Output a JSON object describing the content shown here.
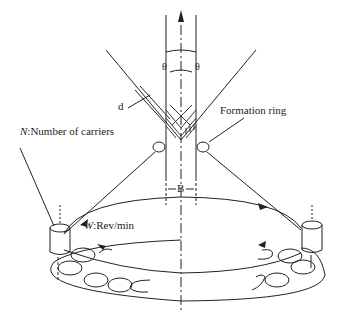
{
  "diagram": {
    "type": "braiding-process-schematic",
    "labels": {
      "carriers_symbol": "N",
      "carriers_text": ":Number of carriers",
      "speed_symbol": "W",
      "speed_text": ":Rev/min",
      "formation_ring": "Formation ring",
      "braid_angle_left": "θ",
      "braid_angle_right": "θ",
      "yarn_width": "d",
      "mandrel_width": "B"
    },
    "colors": {
      "line": "#222222",
      "background": "#ffffff"
    }
  }
}
